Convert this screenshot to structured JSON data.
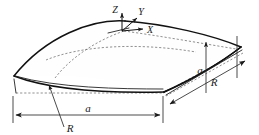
{
  "figure": {
    "type": "engineering-diagram",
    "background_color": "#ffffff",
    "line_color": "#111111",
    "hidden_line_color": "#6b6b6b"
  },
  "axes": {
    "origin_description": "apex of shell top surface",
    "z_label": "Z",
    "y_label": "Y",
    "x_label": "X"
  },
  "dimensions": {
    "front_span_label": "a",
    "side_span_label": "a",
    "front_radius_label": "R",
    "side_radius_label": "R"
  },
  "labels": [
    {
      "id": "axis-z",
      "text": "Z"
    },
    {
      "id": "axis-y",
      "text": "Y"
    },
    {
      "id": "axis-x",
      "text": "X"
    },
    {
      "id": "span-front",
      "text": "a"
    },
    {
      "id": "span-side",
      "text": "a"
    },
    {
      "id": "radius-front",
      "text": "R"
    },
    {
      "id": "radius-side",
      "text": "R"
    }
  ]
}
